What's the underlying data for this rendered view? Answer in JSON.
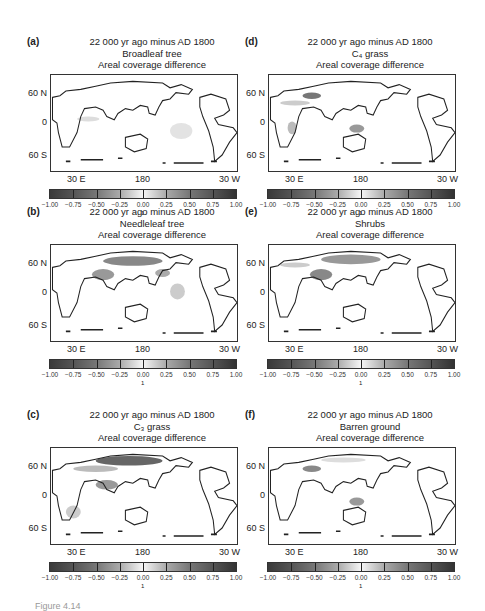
{
  "figure": {
    "panels": [
      {
        "id": "a",
        "label": "(a)",
        "title": "22 000 yr ago minus AD 1800",
        "subtitle": "Broadleaf tree",
        "subtitle2": "Areal coverage difference"
      },
      {
        "id": "b",
        "label": "(b)",
        "title": "22 000 yr ago minus AD 1800",
        "subtitle": "Needleleaf tree",
        "subtitle2": "Areal coverage difference"
      },
      {
        "id": "c",
        "label": "(c)",
        "title": "22 000 yr ago minus AD 1800",
        "subtitle": "C₃ grass",
        "subtitle2": "Areal coverage difference"
      },
      {
        "id": "d",
        "label": "(d)",
        "title": "22 000 yr ago minus AD 1800",
        "subtitle": "C₄ grass",
        "subtitle2": "Areal coverage difference"
      },
      {
        "id": "e",
        "label": "(e)",
        "title": "22 000 yr ago minus AD 1800",
        "subtitle": "Shrubs",
        "subtitle2": "Areal coverage difference"
      },
      {
        "id": "f",
        "label": "(f)",
        "title": "22 000 yr ago minus AD 1800",
        "subtitle": "Barren ground",
        "subtitle2": "Areal coverage difference"
      }
    ],
    "axes": {
      "y_ticks": [
        "60 N",
        "0",
        "60 S"
      ],
      "x_ticks": [
        "30 E",
        "180",
        "30 W"
      ]
    },
    "colorbar": {
      "ticks": [
        "−1.00",
        "−0.75",
        "−0.50",
        "−0.25",
        "0.00",
        "0.25",
        "0.50",
        "0.75",
        "1.00"
      ],
      "unit": "1"
    },
    "caption": "Figure 4.14"
  },
  "chart_data": {
    "type": "heatmap",
    "panels": [
      "Broadleaf tree",
      "Needleleaf tree",
      "C3 grass",
      "C4 grass",
      "Shrubs",
      "Barren ground"
    ],
    "x_tick_labels": [
      "30 E",
      "180",
      "30 W"
    ],
    "y_tick_labels": [
      "60 N",
      "0",
      "60 S"
    ],
    "colorbar_range": [
      -1.0,
      1.0
    ],
    "colorbar_ticks": [
      -1.0,
      -0.75,
      -0.5,
      -0.25,
      0.0,
      0.25,
      0.5,
      0.75,
      1.0
    ],
    "colorbar_unit": "1",
    "layout": "2 columns x 3 rows"
  }
}
